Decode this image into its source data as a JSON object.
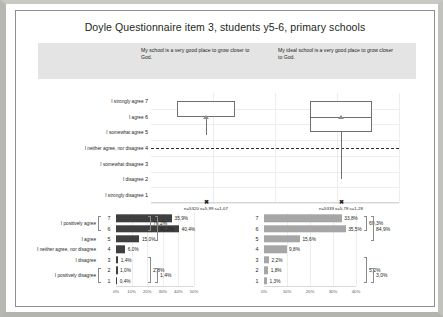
{
  "chart_data": [
    {
      "type": "table",
      "title": "Doyle Questionnaire item 3, students y5-6, primary schools",
      "prompts": {
        "left": "My school is a very good place to grow closer to God.",
        "right": "My ideal school is a very good place to grow closer to God."
      }
    },
    {
      "type": "bar",
      "name": "boxplot-panel",
      "ylabel": "",
      "xlabel": "",
      "ylim": [
        1,
        7
      ],
      "categories": [
        "I strongly agree 7",
        "I agree 6",
        "I somewhat agree 5",
        "I neither agree, nor disagree 4",
        "I somewhat disagree 3",
        "I disagree 2",
        "I strongly disagree 1"
      ],
      "scale_labels": [
        {
          "text": "I strongly agree",
          "num": "7"
        },
        {
          "text": "I agree",
          "num": "6"
        },
        {
          "text": "I somewhat agree",
          "num": "5"
        },
        {
          "text": "I neither agree, nor disagree",
          "num": "4"
        },
        {
          "text": "I somewhat disagree",
          "num": "3"
        },
        {
          "text": "I disagree",
          "num": "2"
        },
        {
          "text": "I strongly disagree",
          "num": "1"
        }
      ],
      "boxes": [
        {
          "name": "left-box",
          "q1": 6.0,
          "q3": 7.0,
          "median": 6.0,
          "mean": 6.0,
          "whisker_low": 4.85,
          "whisker_high": 7.0,
          "note": "n=5320 x̄=5,99 s=1,07",
          "mark": "x"
        },
        {
          "name": "right-box",
          "q1": 5.0,
          "q3": 7.0,
          "median": 6.0,
          "mean": 6.0,
          "whisker_low": 2.0,
          "whisker_high": 7.0,
          "note": "n=5339 x̄=5,78 s=1,28",
          "mark": "x"
        }
      ],
      "reference_line": 4
    },
    {
      "type": "bar",
      "name": "left-distribution",
      "title": "My school is a very good place to grow closer to God.",
      "categories": [
        "7",
        "6",
        "5",
        "4",
        "3",
        "2",
        "1"
      ],
      "values": [
        35.9,
        40.4,
        15.0,
        6.0,
        1.4,
        1.0,
        0.4
      ],
      "value_labels": [
        "35,9%",
        "40,4%",
        "15,0%",
        "6,0%",
        "1,4%",
        "1,0%",
        "0,4%"
      ],
      "xticks": [
        "0%",
        "10%",
        "20%",
        "30%",
        "40%",
        "50%"
      ],
      "xlim": [
        0,
        50
      ],
      "row_labels": [
        {
          "text": "I positively agree",
          "span": [
            "7",
            "6"
          ]
        },
        {
          "text": "I agree",
          "span": [
            "5"
          ]
        },
        {
          "text": "I neither agree, nor disagree",
          "span": [
            "4"
          ]
        },
        {
          "text": "I disagree",
          "span": [
            "3"
          ]
        },
        {
          "text": "I positively disagree",
          "span": [
            "2",
            "1"
          ]
        }
      ],
      "groups": [
        {
          "label": "76,2%",
          "rows": [
            "7",
            "6"
          ]
        },
        {
          "label": "91,2%",
          "rows": [
            "7",
            "6",
            "5"
          ]
        },
        {
          "label": "2,8%",
          "rows": [
            "3",
            "2",
            "1"
          ]
        },
        {
          "label": "1,4%",
          "rows": [
            "2",
            "1"
          ]
        }
      ]
    },
    {
      "type": "bar",
      "name": "right-distribution",
      "title": "My ideal school is a very good place to grow closer to God.",
      "categories": [
        "7",
        "6",
        "5",
        "4",
        "3",
        "2",
        "1"
      ],
      "values": [
        33.8,
        35.5,
        15.6,
        9.8,
        2.2,
        1.8,
        1.3
      ],
      "value_labels": [
        "33,8%",
        "35,5%",
        "15,6%",
        "9,8%",
        "2,2%",
        "1,8%",
        "1,3%"
      ],
      "xticks": [
        "0%",
        "10%",
        "20%",
        "30%",
        "40%"
      ],
      "xlim": [
        0,
        40
      ],
      "groups": [
        {
          "label": "69,3%",
          "rows": [
            "7",
            "6"
          ]
        },
        {
          "label": "84,9%",
          "rows": [
            "7",
            "6",
            "5"
          ]
        },
        {
          "label": "5,2%",
          "rows": [
            "3",
            "2",
            "1"
          ]
        },
        {
          "label": "3,0%",
          "rows": [
            "2",
            "1"
          ]
        }
      ]
    }
  ],
  "title": "Doyle Questionnaire item 3, students y5-6, primary schools",
  "banner": {
    "q1": "My school is a very good place to grow closer to God.",
    "q2": "My ideal school is a very good place to grow closer to God."
  },
  "boxplot": {
    "labels": [
      {
        "text": "I strongly agree",
        "num": "7"
      },
      {
        "text": "I agree",
        "num": "6"
      },
      {
        "text": "I somewhat agree",
        "num": "5"
      },
      {
        "text": "I neither agree, nor disagree",
        "num": "4"
      },
      {
        "text": "I somewhat disagree",
        "num": "3"
      },
      {
        "text": "I disagree",
        "num": "2"
      },
      {
        "text": "I strongly disagree",
        "num": "1"
      }
    ],
    "left_note": "n=5320 x=5,99 s=1,07",
    "right_note": "n=5339 x=5,78 s=1,28",
    "mark_glyph": "✖"
  },
  "left_chart": {
    "rows": [
      {
        "num": "7",
        "value": "35,9%",
        "pct": 35.9
      },
      {
        "num": "6",
        "value": "40,4%",
        "pct": 40.4
      },
      {
        "num": "5",
        "value": "15,0%",
        "pct": 15.0
      },
      {
        "num": "4",
        "value": "6,0%",
        "pct": 6.0
      },
      {
        "num": "3",
        "value": "1,4%",
        "pct": 1.4
      },
      {
        "num": "2",
        "value": "1,0%",
        "pct": 1.0
      },
      {
        "num": "1",
        "value": "0,4%",
        "pct": 0.4
      }
    ],
    "cat_labels": [
      "I positively agree",
      "I agree",
      "I neither agree, nor disagree",
      "I disagree",
      "I positively disagree"
    ],
    "groups": [
      "76,2%",
      "91,2%",
      "2,8%",
      "1,4%"
    ],
    "xticks": [
      "0%",
      "10%",
      "20%",
      "30%",
      "40%",
      "50%"
    ]
  },
  "right_chart": {
    "rows": [
      {
        "num": "7",
        "value": "33,8%",
        "pct": 33.8
      },
      {
        "num": "6",
        "value": "35,5%",
        "pct": 35.5
      },
      {
        "num": "5",
        "value": "15,6%",
        "pct": 15.6
      },
      {
        "num": "4",
        "value": "9,8%",
        "pct": 9.8
      },
      {
        "num": "3",
        "value": "2,2%",
        "pct": 2.2
      },
      {
        "num": "2",
        "value": "1,8%",
        "pct": 1.8
      },
      {
        "num": "1",
        "value": "1,3%",
        "pct": 1.3
      }
    ],
    "groups": [
      "69,3%",
      "84,9%",
      "5,2%",
      "3,0%"
    ],
    "xticks": [
      "0%",
      "10%",
      "20%",
      "30%",
      "40%"
    ]
  },
  "colors": {
    "bar_dark": "#3f3f3f",
    "bar_light": "#a6a6a6",
    "banner": "#e4e4e4",
    "frame": "#8e8e8e"
  }
}
